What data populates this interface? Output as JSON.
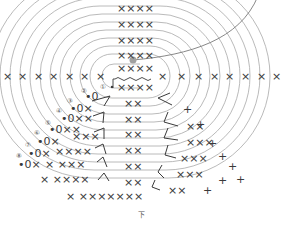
{
  "diagram": {
    "type": "crochet-stitch-chart",
    "shape": "oval",
    "direction_label": "下",
    "round_markers": [
      "①",
      "②",
      "③",
      "④",
      "⑤",
      "⑥",
      "⑦",
      "⑧"
    ],
    "symbols": {
      "single_crochet": "×",
      "increase": "V (shown as ∧/∨ leaning)",
      "chain": "chain-loops",
      "slip_stitch": "●",
      "start_chain": "0"
    },
    "center_chain": "○○○○",
    "top_rows": [
      "XXXX",
      "XXXX",
      "XXXX",
      "XXXX",
      "XXXX"
    ],
    "bottom_rows": [
      "XXXX",
      "XX",
      "XX",
      "XX",
      "XX",
      "XX",
      "XX"
    ],
    "middle_row_left": [
      "×",
      "×",
      "×",
      "×",
      "×",
      "×",
      "×"
    ],
    "middle_row_right": [
      "×",
      "×",
      "×",
      "×",
      "×",
      "×",
      "×",
      "×"
    ],
    "colors": {
      "rings": "#a8a8a8",
      "stitch": "#3a3a3a",
      "marker_dot": "#a0a0a0"
    }
  }
}
